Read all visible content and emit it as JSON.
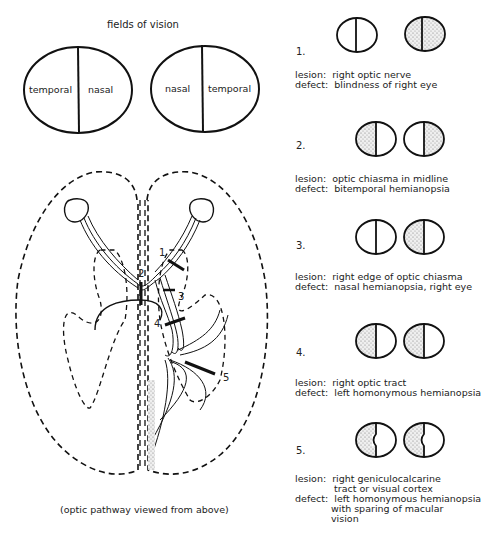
{
  "title": "fields of vision",
  "fields": {
    "left_eye": {
      "left_label": "temporal",
      "right_label": "nasal"
    },
    "right_eye": {
      "left_label": "nasal",
      "right_label": "temporal"
    }
  },
  "pathway": {
    "caption": "(optic pathway viewed from above)",
    "lesion_markers": [
      "1",
      "2",
      "3",
      "4",
      "5"
    ]
  },
  "lesions": [
    {
      "number": "1.",
      "lesion_label": "lesion:",
      "lesion": "right optic nerve",
      "defect_label": "defect:",
      "defect": "blindness of right eye",
      "left_field": "clear",
      "right_field": "full"
    },
    {
      "number": "2.",
      "lesion_label": "lesion:",
      "lesion": "optic chiasma in midline",
      "defect_label": "defect:",
      "defect": "bitemporal hemianopsia",
      "left_field": "left-half",
      "right_field": "right-half"
    },
    {
      "number": "3.",
      "lesion_label": "lesion:",
      "lesion": "right edge of optic chiasma",
      "defect_label": "defect:",
      "defect": "nasal hemianopsia, right eye",
      "left_field": "clear",
      "right_field": "left-half"
    },
    {
      "number": "4.",
      "lesion_label": "lesion:",
      "lesion": "right optic tract",
      "defect_label": "defect:",
      "defect": "left homonymous hemianopsia",
      "left_field": "left-half",
      "right_field": "left-half"
    },
    {
      "number": "5.",
      "lesion_label": "lesion:",
      "lesion": "right geniculocalcarine",
      "lesion_line2": "tract or visual cortex",
      "defect_label": "defect:",
      "defect": "left homonymous hemianopsia",
      "defect_line2": "with sparing of macular",
      "defect_line3": "vision",
      "left_field": "left-half-macular-sparing",
      "right_field": "left-half-macular-sparing"
    }
  ]
}
